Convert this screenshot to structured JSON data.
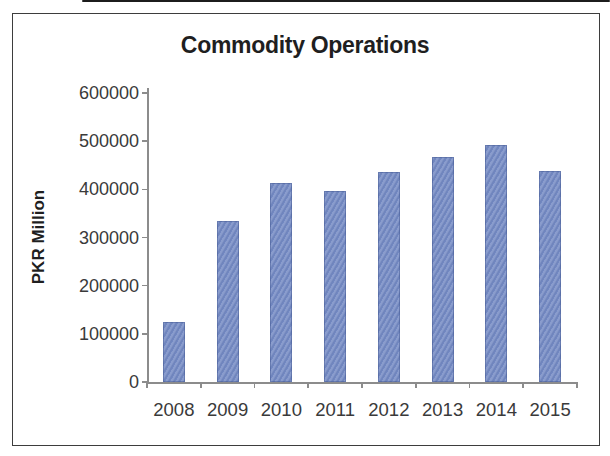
{
  "chart_data": {
    "type": "bar",
    "title": "Commodity Operations",
    "xlabel": "",
    "ylabel": "PKR Million",
    "categories": [
      "2008",
      "2009",
      "2010",
      "2011",
      "2012",
      "2013",
      "2014",
      "2015"
    ],
    "values": [
      125000,
      335000,
      413000,
      397000,
      436000,
      468000,
      493000,
      438000
    ],
    "ylim": [
      0,
      600000
    ],
    "ytick_interval": 100000,
    "ytick_labels": [
      "0",
      "100000",
      "200000",
      "300000",
      "400000",
      "500000",
      "600000"
    ],
    "grid": false,
    "legend": false,
    "colors": {
      "bar": "#7389c3",
      "axis": "#8c8c8c",
      "tick_label_text": "#3a3a3a",
      "title_text": "#1f1f1f",
      "frame_border": "#3d3d3d",
      "scan_line": "#1c1c1c",
      "background": "#ffffff"
    }
  }
}
